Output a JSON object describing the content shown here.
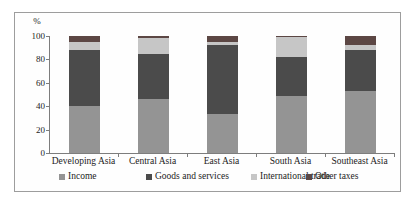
{
  "figure": {
    "frame_border_color": "#9d9d9d",
    "axis_color": "#7d7d7d",
    "background_color": "#ffffff",
    "y_axis_unit": "%",
    "y_ticks": [
      0,
      20,
      40,
      60,
      80,
      100
    ]
  },
  "chart_data": {
    "type": "bar",
    "stacked": true,
    "title": "",
    "xlabel": "",
    "ylabel": "%",
    "ylim": [
      0,
      100
    ],
    "grid": false,
    "legend_position": "bottom",
    "categories": [
      "Developing Asia",
      "Central Asia",
      "East Asia",
      "South Asia",
      "Southeast Asia"
    ],
    "series": [
      {
        "name": "Income",
        "color": "#949494",
        "values": [
          40,
          46,
          33,
          49,
          53
        ]
      },
      {
        "name": "Goods and services",
        "color": "#4b4b4b",
        "values": [
          48,
          39,
          59,
          33,
          35
        ]
      },
      {
        "name": "International trade",
        "color": "#c6c6c6",
        "values": [
          7,
          13,
          3,
          17,
          4
        ]
      },
      {
        "name": "Other taxes",
        "color": "#5c4744",
        "values": [
          5,
          2,
          5,
          1,
          8
        ]
      }
    ]
  }
}
